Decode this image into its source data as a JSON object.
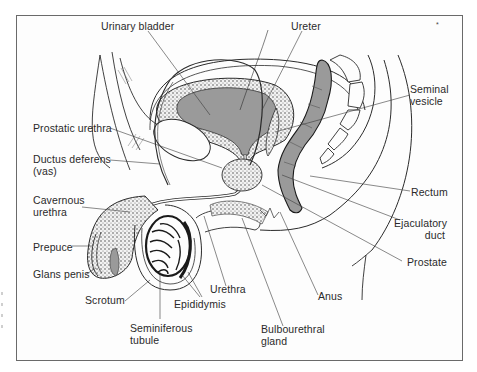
{
  "figure": {
    "colors": {
      "tissue_fill": "#9a9a9a",
      "line": "#2b2b2b",
      "frame": "#6a6a6a",
      "background": "#ffffff"
    },
    "corner_mark": "*"
  },
  "labels": {
    "urinary_bladder": [
      "Urinary bladder"
    ],
    "ureter": [
      "Ureter"
    ],
    "seminal_vesicle": [
      "Seminal",
      "vesicle"
    ],
    "prostatic_urethra": [
      "Prostatic urethra"
    ],
    "ductus_deferens": [
      "Ductus deferens",
      "(vas)"
    ],
    "cavernous_urethra": [
      "Cavernous",
      "urethra"
    ],
    "prepuce": [
      "Prepuce"
    ],
    "glans_penis": [
      "Glans penis"
    ],
    "scrotum": [
      "Scrotum"
    ],
    "epididymis": [
      "Epididymis"
    ],
    "seminiferous_tubule": [
      "Seminiferous",
      "tubule"
    ],
    "urethra": [
      "Urethra"
    ],
    "bulbourethral_gland": [
      "Bulbourethral",
      "gland"
    ],
    "anus": [
      "Anus"
    ],
    "rectum": [
      "Rectum"
    ],
    "ejaculatory_duct": [
      "Ejaculatory",
      "duct"
    ],
    "prostate": [
      "Prostate"
    ]
  }
}
